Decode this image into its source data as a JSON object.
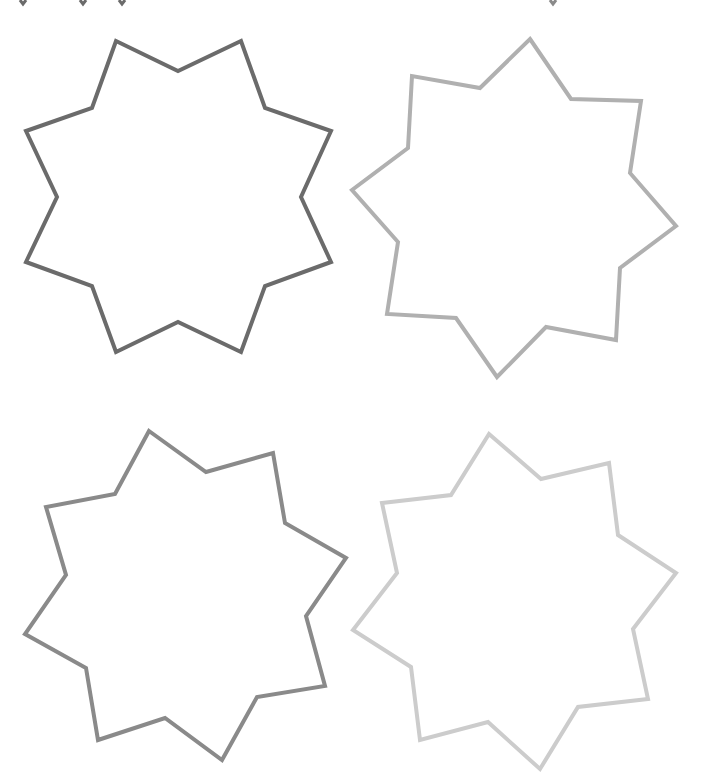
{
  "canvas": {
    "width": 711,
    "height": 783,
    "background": "#ffffff"
  },
  "shapes": [
    {
      "id": "star-1",
      "type": "eight-point-star",
      "stroke": "#6b6b6b",
      "center": [
        178,
        197
      ],
      "points": "116,41 178,71 241,41 265,108 331,131 301,197 331,262 265,286 241,352 178,322 116,352 92,286 26,262 57,197 26,131 92,108"
    },
    {
      "id": "star-2",
      "type": "eight-point-star",
      "stroke": "#b0b0b0",
      "center": [
        514,
        208
      ],
      "points": "530,39 571,99 641,101 630,173 676,226 620,268 616,340 546,327 497,377 456,318 387,314 398,242 352,190 408,148 412,76 480,88"
    },
    {
      "id": "star-3",
      "type": "eight-point-star",
      "stroke": "#8a8a8a",
      "center": [
        186,
        596
      ],
      "points": "149,431 206,472 273,453 285,523 346,558 306,616 325,686 257,697 222,760 165,718 98,740 86,668 25,634 66,575 46,507 115,494"
    },
    {
      "id": "star-4",
      "type": "eight-point-star",
      "stroke": "#cccccc",
      "center": [
        515,
        601
      ],
      "points": "489,434 541,479 609,463 618,535 676,573 633,629 648,699 578,707 540,769 488,722 420,740 411,667 353,630 397,573 382,503 451,495"
    }
  ],
  "edge_fragments": [
    {
      "id": "tip-1",
      "stroke": "#6b6b6b",
      "points": "20,0 23,4 26,0"
    },
    {
      "id": "tip-2",
      "stroke": "#6b6b6b",
      "points": "80,0 83,4 86,0"
    },
    {
      "id": "tip-3",
      "stroke": "#6b6b6b",
      "points": "119,0 122,4 125,0"
    },
    {
      "id": "tip-4",
      "stroke": "#8a8a8a",
      "points": "550,0 553,4 556,0"
    }
  ]
}
